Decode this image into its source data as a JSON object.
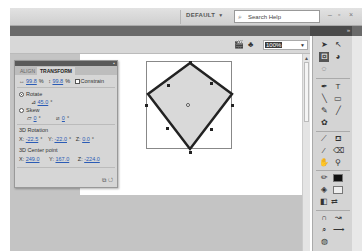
{
  "titlebar": {
    "workspace": "DEFAULT",
    "search_placeholder": "Search Help",
    "minimize": "–",
    "restore": "▫",
    "close": "×"
  },
  "editbar": {
    "zoom_value": "100%"
  },
  "transform_panel": {
    "tabs": [
      {
        "label": "ALIGN",
        "active": false
      },
      {
        "label": "TRANSFORM",
        "active": true
      }
    ],
    "scale_width": "99.8",
    "scale_height": "99.8",
    "percent": "%",
    "constrain_label": "Constrain",
    "rotate_label": "Rotate",
    "rotate_value": "45.0",
    "degree": "°",
    "skew_label": "Skew",
    "skew_h": "0",
    "skew_v": "0",
    "rotation3d_label": "3D Rotation",
    "rot_x_label": "X:",
    "rot_x": "-22.5",
    "rot_y_label": "Y:",
    "rot_y": "-22.0",
    "rot_z_label": "Z:",
    "rot_z": "0.0",
    "center3d_label": "3D Center point",
    "cen_x_label": "X:",
    "cen_x": "249.0",
    "cen_y_label": "Y:",
    "cen_y": "167.0",
    "cen_z_label": "Z:",
    "cen_z": "-224.0"
  },
  "colors": {
    "stroke": "#222222",
    "fill": "#d9d9d9",
    "fill_swatch": "#eeeeee",
    "stroke_swatch": "#111111"
  }
}
